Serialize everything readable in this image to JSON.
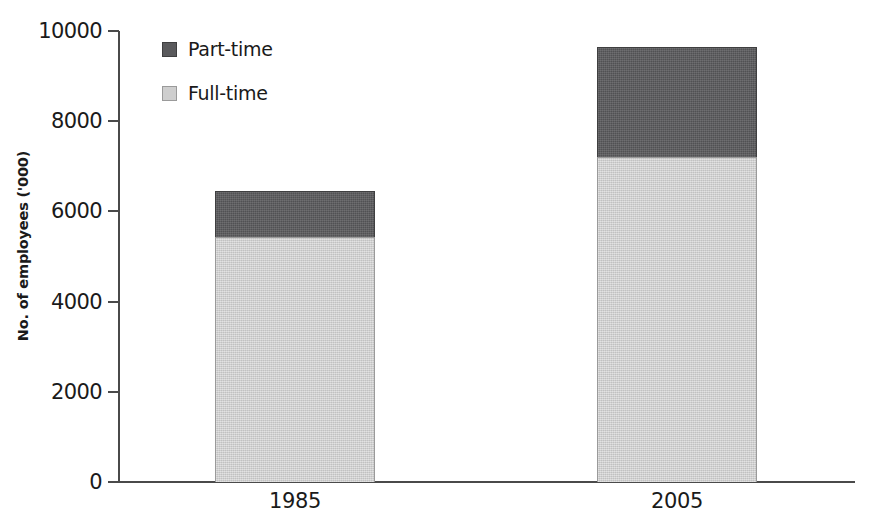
{
  "chart_data": {
    "type": "bar",
    "title": "",
    "subtitle": "",
    "xlabel": "",
    "ylabel": "No. of employees ('000)",
    "categories": [
      "1985",
      "2005"
    ],
    "series": [
      {
        "name": "Full-time",
        "values": [
          5430,
          7200
        ],
        "color": "#cecece"
      },
      {
        "name": "Part-time",
        "values": [
          1020,
          2450
        ],
        "color": "#5a5a5c"
      }
    ],
    "totals": [
      6450,
      9650
    ],
    "stacked": true,
    "ylim": [
      0,
      10000
    ],
    "yticks": [
      0,
      2000,
      4000,
      6000,
      8000,
      10000
    ],
    "ytick_labels": [
      "0",
      "2000",
      "4000",
      "6000",
      "8000",
      "10000"
    ],
    "grid": false,
    "legend_position": "top-left",
    "legend_order": [
      "Part-time",
      "Full-time"
    ]
  },
  "axis": {
    "y_title": "No. of employees ('000)",
    "y_tick_labels": [
      "10000",
      "8000",
      "6000",
      "4000",
      "2000",
      "0"
    ],
    "x_tick_labels": [
      "1985",
      "2005"
    ]
  },
  "legend": {
    "items": [
      {
        "label": "Part-time",
        "swatch": "dark-gray-swatch-icon"
      },
      {
        "label": "Full-time",
        "swatch": "light-gray-swatch-icon"
      }
    ]
  }
}
